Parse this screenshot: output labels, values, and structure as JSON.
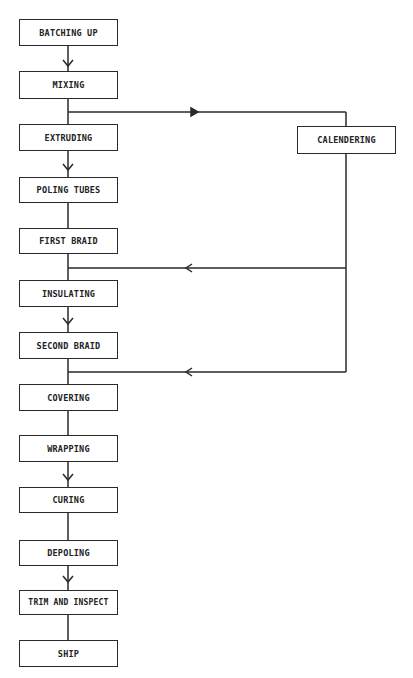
{
  "diagram": {
    "type": "process-flowchart",
    "main_steps": [
      {
        "id": "batching-up",
        "label": "BATCHING UP",
        "x": 19,
        "y": 19,
        "w": 99,
        "h": 27
      },
      {
        "id": "mixing",
        "label": "MIXING",
        "x": 19,
        "y": 71,
        "w": 99,
        "h": 28
      },
      {
        "id": "extruding",
        "label": "EXTRUDING",
        "x": 19,
        "y": 124,
        "w": 99,
        "h": 27
      },
      {
        "id": "poling-tubes",
        "label": "POLING TUBES",
        "x": 19,
        "y": 177,
        "w": 99,
        "h": 26
      },
      {
        "id": "first-braid",
        "label": "FIRST BRAID",
        "x": 19,
        "y": 228,
        "w": 99,
        "h": 26
      },
      {
        "id": "insulating",
        "label": "INSULATING",
        "x": 19,
        "y": 280,
        "w": 99,
        "h": 27
      },
      {
        "id": "second-braid",
        "label": "SECOND BRAID",
        "x": 19,
        "y": 332,
        "w": 99,
        "h": 27
      },
      {
        "id": "covering",
        "label": "COVERING",
        "x": 19,
        "y": 384,
        "w": 99,
        "h": 27
      },
      {
        "id": "wrapping",
        "label": "WRAPPING",
        "x": 19,
        "y": 435,
        "w": 99,
        "h": 27
      },
      {
        "id": "curing",
        "label": "CURING",
        "x": 19,
        "y": 487,
        "w": 99,
        "h": 26
      },
      {
        "id": "depoling",
        "label": "DEPOLING",
        "x": 19,
        "y": 540,
        "w": 99,
        "h": 26
      },
      {
        "id": "trim-and-inspect",
        "label": "TRIM AND INSPECT",
        "x": 19,
        "y": 590,
        "w": 99,
        "h": 25
      },
      {
        "id": "ship",
        "label": "SHIP",
        "x": 19,
        "y": 640,
        "w": 99,
        "h": 27
      }
    ],
    "side_steps": [
      {
        "id": "calendering",
        "label": "CALENDERING",
        "x": 297,
        "y": 126,
        "w": 99,
        "h": 28
      }
    ],
    "connections": [
      {
        "from": "MIXING",
        "to": "CALENDERING",
        "branch_y": 112
      },
      {
        "from": "CALENDERING",
        "to": "INSULATING",
        "join_y": 268
      },
      {
        "from": "CALENDERING",
        "to": "COVERING",
        "join_y": 372
      }
    ]
  }
}
